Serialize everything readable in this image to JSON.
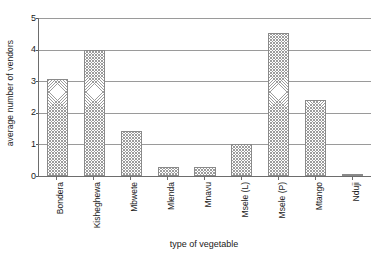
{
  "chart_data": {
    "type": "bar",
    "title": "",
    "xlabel": "type of vegetable",
    "ylabel": "average number of vendors",
    "categories": [
      "Bondera",
      "Kisheghewa",
      "Mbwete",
      "Mlenda",
      "Mnavu",
      "Msele (L)",
      "Msele (P)",
      "Mtango",
      "Nduji"
    ],
    "values": [
      3.07,
      4.0,
      1.42,
      0.29,
      0.29,
      1.0,
      4.53,
      2.42,
      0.03
    ],
    "ylim": [
      0,
      5
    ],
    "yticks": [
      0,
      1,
      2,
      3,
      4,
      5
    ],
    "ytick_labels": [
      "0",
      "1",
      "2",
      "3",
      "4",
      "5"
    ],
    "grid": "horizontal",
    "legend": "none",
    "bar_fill": "#9c9c9c",
    "bar_edge": "#8a8a8a",
    "axis_color": "#6d6d6d",
    "grid_color": "#9a9a9a"
  }
}
